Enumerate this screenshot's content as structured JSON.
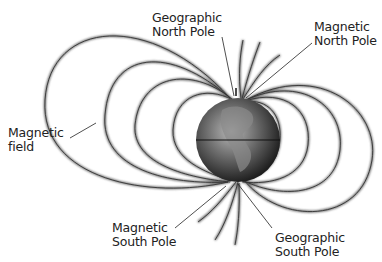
{
  "diagram": {
    "labels": {
      "geographic_north": {
        "line1": "Geographic",
        "line2": "North Pole"
      },
      "magnetic_north": {
        "line1": "Magnetic",
        "line2": "North Pole"
      },
      "magnetic_field": {
        "line1": "Magnetic",
        "line2": "field"
      },
      "magnetic_south": {
        "line1": "Magnetic",
        "line2": "South Pole"
      },
      "geographic_south": {
        "line1": "Geographic",
        "line2": "South Pole"
      }
    },
    "colors": {
      "field_line": "#555555",
      "globe_dark": "#1a1a1a",
      "globe_light": "#9a9a9a",
      "text": "#222222"
    }
  }
}
